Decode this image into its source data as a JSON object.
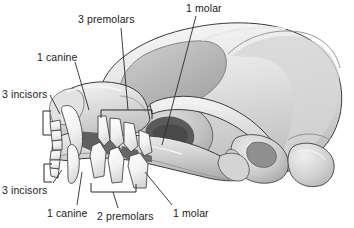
{
  "figure": {
    "view": "lateral",
    "style": "grayscale-anatomical-illustration",
    "background_color": "#ffffff",
    "line_color": "#2a2a2a",
    "label_text_color": "#1b1b1b",
    "bone_light": "#f2f2f2",
    "bone_mid": "#c9c9c9",
    "bone_dark": "#a9a9a9",
    "shadow_dark": "#6a6a6a",
    "tooth_color": "#fbfbfb"
  },
  "labels": {
    "premolars_upper": "3 premolars",
    "molar_upper": "1 molar",
    "canine_upper": "1 canine",
    "incisors_upper": "3 incisors",
    "incisors_lower": "3 incisors",
    "canine_lower": "1 canine",
    "premolars_lower": "2 premolars",
    "molar_lower": "1 molar"
  },
  "annotations": {
    "brackets": [
      {
        "name": "upper-incisors-bracket",
        "orientation": "vertical-left"
      },
      {
        "name": "lower-incisors-bracket",
        "orientation": "vertical-left"
      },
      {
        "name": "upper-premolars-bracket",
        "orientation": "horizontal-top"
      },
      {
        "name": "lower-premolars-bracket",
        "orientation": "horizontal-bottom"
      }
    ],
    "leader_lines": [
      {
        "name": "leader-premolars-upper"
      },
      {
        "name": "leader-molar-upper"
      },
      {
        "name": "leader-canine-upper"
      },
      {
        "name": "leader-incisors-upper"
      },
      {
        "name": "leader-incisors-lower"
      },
      {
        "name": "leader-canine-lower"
      },
      {
        "name": "leader-premolars-lower"
      },
      {
        "name": "leader-molar-lower"
      }
    ]
  }
}
